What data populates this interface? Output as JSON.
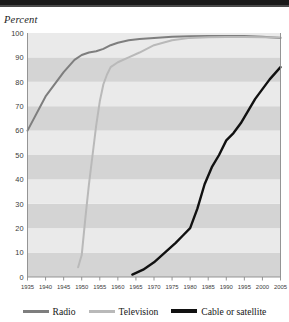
{
  "header": {
    "bar_color": "#1a1a1a"
  },
  "axis_title": "Percent",
  "colors": {
    "radio": "#7e7e7e",
    "television": "#b9b9b9",
    "cable": "#111111",
    "band_dark": "#d4d4d4",
    "band_light": "#eaeaea",
    "axis": "#8a8a8a",
    "text": "#3a3a3a"
  },
  "legend": {
    "position": "bottom",
    "items": [
      {
        "label": "Radio",
        "color": "#7e7e7e",
        "key": "radio"
      },
      {
        "label": "Television",
        "color": "#b9b9b9",
        "key": "television"
      },
      {
        "label": "Cable or satellite",
        "color": "#111111",
        "key": "cable"
      }
    ]
  },
  "chart_data": {
    "type": "line",
    "title": "",
    "subtitle": "",
    "xlabel": "",
    "ylabel": "Percent",
    "xlim": [
      1935,
      2005
    ],
    "ylim": [
      0,
      100
    ],
    "grid": false,
    "banded_background": true,
    "band_step": 10,
    "x_ticks": [
      1935,
      1940,
      1945,
      1950,
      1955,
      1960,
      1965,
      1970,
      1975,
      1980,
      1985,
      1990,
      1995,
      2000,
      2005
    ],
    "y_ticks": [
      0,
      10,
      20,
      30,
      40,
      50,
      60,
      70,
      80,
      90,
      100
    ],
    "x_tick_labels": [
      "1935",
      "1940",
      "1945",
      "1950",
      "1955",
      "1960",
      "1965",
      "1970",
      "1975",
      "1980",
      "1985",
      "1990",
      "1995",
      "2000",
      "2005"
    ],
    "y_tick_labels": [
      "0",
      "10",
      "20",
      "30",
      "40",
      "50",
      "60",
      "70",
      "80",
      "90",
      "100"
    ],
    "legend_position": "bottom",
    "series": [
      {
        "name": "Radio",
        "color": "#7e7e7e",
        "points": [
          [
            1935,
            60
          ],
          [
            1940,
            74
          ],
          [
            1945,
            84
          ],
          [
            1948,
            89
          ],
          [
            1950,
            91
          ],
          [
            1952,
            92
          ],
          [
            1954,
            92.5
          ],
          [
            1956,
            93.5
          ],
          [
            1958,
            95
          ],
          [
            1960,
            96
          ],
          [
            1963,
            97
          ],
          [
            1966,
            97.5
          ],
          [
            1970,
            98
          ],
          [
            1975,
            98.5
          ],
          [
            1980,
            98.7
          ],
          [
            1985,
            98.8
          ],
          [
            1990,
            98.8
          ],
          [
            1995,
            98.8
          ],
          [
            2000,
            98.5
          ],
          [
            2005,
            98
          ]
        ]
      },
      {
        "name": "Television",
        "color": "#b9b9b9",
        "points": [
          [
            1949,
            4
          ],
          [
            1950,
            9
          ],
          [
            1951,
            24
          ],
          [
            1952,
            38
          ],
          [
            1953,
            50
          ],
          [
            1954,
            62
          ],
          [
            1955,
            72
          ],
          [
            1956,
            79
          ],
          [
            1957,
            83
          ],
          [
            1958,
            86
          ],
          [
            1960,
            88
          ],
          [
            1963,
            90
          ],
          [
            1966,
            92
          ],
          [
            1970,
            95
          ],
          [
            1975,
            97
          ],
          [
            1980,
            98
          ],
          [
            1985,
            98.3
          ],
          [
            1990,
            98.4
          ],
          [
            1995,
            98.4
          ],
          [
            2000,
            98.3
          ],
          [
            2005,
            98.2
          ]
        ]
      },
      {
        "name": "Cable or satellite",
        "color": "#111111",
        "points": [
          [
            1964,
            1
          ],
          [
            1967,
            3
          ],
          [
            1970,
            6
          ],
          [
            1973,
            10
          ],
          [
            1976,
            14
          ],
          [
            1978,
            17
          ],
          [
            1980,
            20
          ],
          [
            1982,
            28
          ],
          [
            1984,
            38
          ],
          [
            1986,
            45
          ],
          [
            1988,
            50
          ],
          [
            1990,
            56
          ],
          [
            1992,
            59
          ],
          [
            1994,
            63
          ],
          [
            1996,
            68
          ],
          [
            1998,
            73
          ],
          [
            2000,
            77
          ],
          [
            2002,
            81
          ],
          [
            2005,
            86
          ]
        ]
      }
    ]
  }
}
